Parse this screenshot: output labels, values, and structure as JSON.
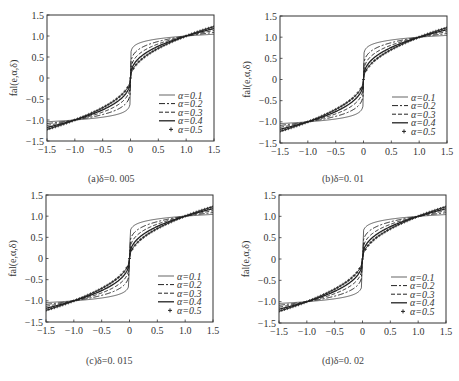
{
  "chart_data": [
    {
      "type": "line",
      "panel": "a",
      "caption": "(a)δ=0. 005",
      "delta": 0.005,
      "title": "",
      "xlabel": "",
      "ylabel": "fal(e,α,δ)",
      "xlim": [
        -1.5,
        1.5
      ],
      "ylim": [
        -1.5,
        1.5
      ],
      "xticks": [
        "-1.5",
        "-1.0",
        "-0.5",
        "0",
        "0.5",
        "1.0",
        "1.5"
      ],
      "yticks": [
        "1.5",
        "1.0",
        "0.5",
        "0",
        "-0.5",
        "-1.0",
        "-1.5"
      ],
      "grid": false,
      "legend_position": "lower right",
      "series": [
        {
          "name": "α=0.1",
          "alpha": 0.1,
          "style": "thin-solid",
          "x": [
            -1.5,
            -1.0,
            -0.5,
            -0.1,
            0,
            0.1,
            0.5,
            1.0,
            1.5
          ],
          "values": [
            -1.04,
            -1.0,
            -0.93,
            -0.79,
            0,
            0.79,
            0.93,
            1.0,
            1.04
          ]
        },
        {
          "name": "α=0.2",
          "alpha": 0.2,
          "style": "dash-dot",
          "x": [
            -1.5,
            -1.0,
            -0.5,
            -0.1,
            0,
            0.1,
            0.5,
            1.0,
            1.5
          ],
          "values": [
            -1.08,
            -1.0,
            -0.87,
            -0.63,
            0,
            0.63,
            0.87,
            1.0,
            1.08
          ]
        },
        {
          "name": "α=0.3",
          "alpha": 0.3,
          "style": "dashed",
          "x": [
            -1.5,
            -1.0,
            -0.5,
            -0.1,
            0,
            0.1,
            0.5,
            1.0,
            1.5
          ],
          "values": [
            -1.13,
            -1.0,
            -0.81,
            -0.5,
            0,
            0.5,
            0.81,
            1.0,
            1.13
          ]
        },
        {
          "name": "α=0.4",
          "alpha": 0.4,
          "style": "solid",
          "x": [
            -1.5,
            -1.0,
            -0.5,
            -0.1,
            0,
            0.1,
            0.5,
            1.0,
            1.5
          ],
          "values": [
            -1.18,
            -1.0,
            -0.76,
            -0.4,
            0,
            0.4,
            0.76,
            1.0,
            1.18
          ]
        },
        {
          "name": "α=0.5",
          "alpha": 0.5,
          "style": "plus-markers",
          "x": [
            -1.5,
            -1.0,
            -0.5,
            -0.1,
            0,
            0.1,
            0.5,
            1.0,
            1.5
          ],
          "values": [
            -1.22,
            -1.0,
            -0.71,
            -0.32,
            0,
            0.32,
            0.71,
            1.0,
            1.22
          ]
        }
      ]
    },
    {
      "type": "line",
      "panel": "b",
      "caption": "(b)δ=0. 01",
      "delta": 0.01,
      "title": "",
      "xlabel": "",
      "ylabel": "fal(e,α,δ)",
      "xlim": [
        -1.5,
        1.5
      ],
      "ylim": [
        -1.5,
        1.5
      ],
      "xticks": [
        "-1.5",
        "-1.0",
        "-0.5",
        "0",
        "0.5",
        "1.0",
        "1.5"
      ],
      "yticks": [
        "1.5",
        "1.0",
        "0.5",
        "0",
        "-0.5",
        "-1.0",
        "-1.5"
      ],
      "grid": false,
      "legend_position": "lower right",
      "series": [
        {
          "name": "α=0.1",
          "alpha": 0.1,
          "style": "thin-solid",
          "x": [
            -1.5,
            -1.0,
            -0.5,
            -0.1,
            0,
            0.1,
            0.5,
            1.0,
            1.5
          ],
          "values": [
            -1.04,
            -1.0,
            -0.93,
            -0.79,
            0,
            0.79,
            0.93,
            1.0,
            1.04
          ]
        },
        {
          "name": "α=0.2",
          "alpha": 0.2,
          "style": "dash-dot",
          "x": [
            -1.5,
            -1.0,
            -0.5,
            -0.1,
            0,
            0.1,
            0.5,
            1.0,
            1.5
          ],
          "values": [
            -1.08,
            -1.0,
            -0.87,
            -0.63,
            0,
            0.63,
            0.87,
            1.0,
            1.08
          ]
        },
        {
          "name": "α=0.3",
          "alpha": 0.3,
          "style": "dashed",
          "x": [
            -1.5,
            -1.0,
            -0.5,
            -0.1,
            0,
            0.1,
            0.5,
            1.0,
            1.5
          ],
          "values": [
            -1.13,
            -1.0,
            -0.81,
            -0.5,
            0,
            0.5,
            0.81,
            1.0,
            1.13
          ]
        },
        {
          "name": "α=0.4",
          "alpha": 0.4,
          "style": "solid",
          "x": [
            -1.5,
            -1.0,
            -0.5,
            -0.1,
            0,
            0.1,
            0.5,
            1.0,
            1.5
          ],
          "values": [
            -1.18,
            -1.0,
            -0.76,
            -0.4,
            0,
            0.4,
            0.76,
            1.0,
            1.18
          ]
        },
        {
          "name": "α=0.5",
          "alpha": 0.5,
          "style": "plus-markers",
          "x": [
            -1.5,
            -1.0,
            -0.5,
            -0.1,
            0,
            0.1,
            0.5,
            1.0,
            1.5
          ],
          "values": [
            -1.22,
            -1.0,
            -0.71,
            -0.32,
            0,
            0.32,
            0.71,
            1.0,
            1.22
          ]
        }
      ]
    },
    {
      "type": "line",
      "panel": "c",
      "caption": "(c)δ=0. 015",
      "delta": 0.015,
      "title": "",
      "xlabel": "",
      "ylabel": "fal(e,α,δ)",
      "xlim": [
        -1.5,
        1.5
      ],
      "ylim": [
        -1.5,
        1.5
      ],
      "xticks": [
        "-1.5",
        "-1.0",
        "-0.5",
        "0",
        "0.5",
        "1.0",
        "1.5"
      ],
      "yticks": [
        "1.5",
        "1.0",
        "0.5",
        "0",
        "-0.5",
        "-1.0",
        "-1.5"
      ],
      "grid": false,
      "legend_position": "lower right",
      "series": [
        {
          "name": "α=0.1",
          "alpha": 0.1,
          "style": "thin-solid",
          "x": [
            -1.5,
            -1.0,
            -0.5,
            -0.1,
            0,
            0.1,
            0.5,
            1.0,
            1.5
          ],
          "values": [
            -1.04,
            -1.0,
            -0.93,
            -0.79,
            0,
            0.79,
            0.93,
            1.0,
            1.04
          ]
        },
        {
          "name": "α=0.2",
          "alpha": 0.2,
          "style": "dash-dot",
          "x": [
            -1.5,
            -1.0,
            -0.5,
            -0.1,
            0,
            0.1,
            0.5,
            1.0,
            1.5
          ],
          "values": [
            -1.08,
            -1.0,
            -0.87,
            -0.63,
            0,
            0.63,
            0.87,
            1.0,
            1.08
          ]
        },
        {
          "name": "α=0.3",
          "alpha": 0.3,
          "style": "dashed",
          "x": [
            -1.5,
            -1.0,
            -0.5,
            -0.1,
            0,
            0.1,
            0.5,
            1.0,
            1.5
          ],
          "values": [
            -1.13,
            -1.0,
            -0.81,
            -0.5,
            0,
            0.5,
            0.81,
            1.0,
            1.13
          ]
        },
        {
          "name": "α=0.4",
          "alpha": 0.4,
          "style": "solid",
          "x": [
            -1.5,
            -1.0,
            -0.5,
            -0.1,
            0,
            0.1,
            0.5,
            1.0,
            1.5
          ],
          "values": [
            -1.18,
            -1.0,
            -0.76,
            -0.4,
            0,
            0.4,
            0.76,
            1.0,
            1.18
          ]
        },
        {
          "name": "α=0.5",
          "alpha": 0.5,
          "style": "plus-markers",
          "x": [
            -1.5,
            -1.0,
            -0.5,
            -0.1,
            0,
            0.1,
            0.5,
            1.0,
            1.5
          ],
          "values": [
            -1.22,
            -1.0,
            -0.71,
            -0.32,
            0,
            0.32,
            0.71,
            1.0,
            1.22
          ]
        }
      ]
    },
    {
      "type": "line",
      "panel": "d",
      "caption": "(d)δ=0. 02",
      "delta": 0.02,
      "title": "",
      "xlabel": "",
      "ylabel": "fal(e,α,δ)",
      "xlim": [
        -1.5,
        1.5
      ],
      "ylim": [
        -1.5,
        1.5
      ],
      "xticks": [
        "-1.5",
        "-1.0",
        "-0.5",
        "0",
        "0.5",
        "1.0",
        "1.5"
      ],
      "yticks": [
        "1.5",
        "1.0",
        "0.5",
        "0",
        "-0.5",
        "-1.0",
        "-1.5"
      ],
      "grid": false,
      "legend_position": "lower right",
      "series": [
        {
          "name": "α=0.1",
          "alpha": 0.1,
          "style": "thin-solid",
          "x": [
            -1.5,
            -1.0,
            -0.5,
            -0.1,
            0,
            0.1,
            0.5,
            1.0,
            1.5
          ],
          "values": [
            -1.04,
            -1.0,
            -0.93,
            -0.79,
            0,
            0.79,
            0.93,
            1.0,
            1.04
          ]
        },
        {
          "name": "α=0.2",
          "alpha": 0.2,
          "style": "dash-dot",
          "x": [
            -1.5,
            -1.0,
            -0.5,
            -0.1,
            0,
            0.1,
            0.5,
            1.0,
            1.5
          ],
          "values": [
            -1.08,
            -1.0,
            -0.87,
            -0.63,
            0,
            0.63,
            0.87,
            1.0,
            1.08
          ]
        },
        {
          "name": "α=0.3",
          "alpha": 0.3,
          "style": "dashed",
          "x": [
            -1.5,
            -1.0,
            -0.5,
            -0.1,
            0,
            0.1,
            0.5,
            1.0,
            1.5
          ],
          "values": [
            -1.13,
            -1.0,
            -0.81,
            -0.5,
            0,
            0.5,
            0.81,
            1.0,
            1.13
          ]
        },
        {
          "name": "α=0.4",
          "alpha": 0.4,
          "style": "solid",
          "x": [
            -1.5,
            -1.0,
            -0.5,
            -0.1,
            0,
            0.1,
            0.5,
            1.0,
            1.5
          ],
          "values": [
            -1.18,
            -1.0,
            -0.76,
            -0.4,
            0,
            0.4,
            0.76,
            1.0,
            1.18
          ]
        },
        {
          "name": "α=0.5",
          "alpha": 0.5,
          "style": "plus-markers",
          "x": [
            -1.5,
            -1.0,
            -0.5,
            -0.1,
            0,
            0.1,
            0.5,
            1.0,
            1.5
          ],
          "values": [
            -1.22,
            -1.0,
            -0.71,
            -0.32,
            0,
            0.32,
            0.71,
            1.0,
            1.22
          ]
        }
      ]
    }
  ],
  "colors": {
    "axis": "#333333",
    "curve": "#222222",
    "text": "#333333"
  }
}
